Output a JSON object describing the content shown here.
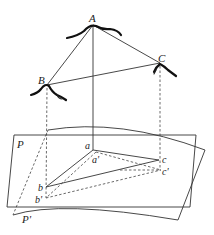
{
  "figure": {
    "points": {
      "A": {
        "label": "A",
        "x": 93,
        "y": 25
      },
      "B": {
        "label": "B",
        "x": 47,
        "y": 85
      },
      "C": {
        "label": "C",
        "x": 160,
        "y": 63
      },
      "a": {
        "label": "a",
        "x": 93,
        "y": 150
      },
      "b": {
        "label": "b",
        "x": 46,
        "y": 187
      },
      "c": {
        "label": "c",
        "x": 159,
        "y": 160
      },
      "a_prime": {
        "label": "a'",
        "x": 100,
        "y": 155
      },
      "b_prime": {
        "label": "b'",
        "x": 46,
        "y": 198
      },
      "c_prime": {
        "label": "c'",
        "x": 161,
        "y": 170
      }
    },
    "planes": {
      "P": {
        "label": "P"
      },
      "P_prime": {
        "label": "P'"
      }
    }
  }
}
